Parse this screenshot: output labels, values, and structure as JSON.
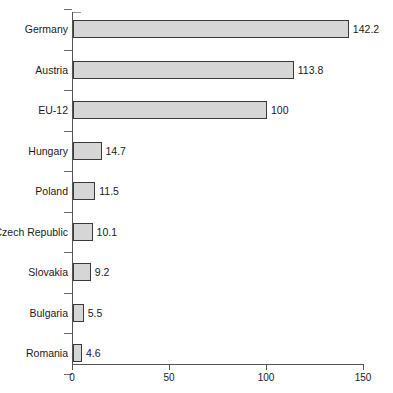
{
  "chart_data": {
    "type": "bar",
    "orientation": "horizontal",
    "title": "",
    "subtitle": "",
    "xlabel": "",
    "ylabel": "",
    "categories": [
      "Germany",
      "Austria",
      "EU-12",
      "Hungary",
      "Poland",
      "Czech Republic",
      "Slovakia",
      "Bulgaria",
      "Romania"
    ],
    "values": [
      142.2,
      113.8,
      100,
      14.7,
      11.5,
      10.1,
      9.2,
      5.5,
      4.6
    ],
    "value_labels": [
      "142.2",
      "113.8",
      "100",
      "14.7",
      "11.5",
      "10.1",
      "9.2",
      "5.5",
      "4.6"
    ],
    "xlim": [
      0,
      150
    ],
    "xticks": [
      0,
      50,
      100,
      150
    ],
    "xticklabels": [
      "0",
      "50",
      "100",
      "150"
    ],
    "grid": false,
    "legend": null,
    "bar_fill": "#d6d6d6",
    "bar_border": "#3a3a3a",
    "axis_color": "#555555"
  }
}
